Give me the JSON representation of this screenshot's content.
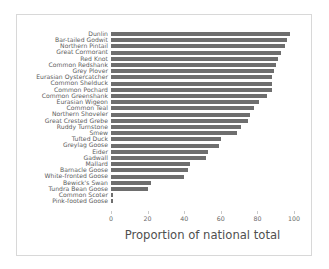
{
  "chart_data": {
    "type": "bar",
    "orientation": "horizontal",
    "title": "",
    "xlabel": "Proportion of national total",
    "ylabel": "",
    "xlim": [
      0,
      100
    ],
    "xticks": [
      0,
      20,
      40,
      60,
      80,
      100
    ],
    "xtick_labels": [
      "0",
      "20",
      "40",
      "60",
      "80",
      "100"
    ],
    "grid": false,
    "legend": null,
    "bar_color": "#6e6e6e",
    "categories": [
      "Dunlin",
      "Bar-tailed Godwit",
      "Northern Pintail",
      "Great Cormorant",
      "Red Knot",
      "Common Redshank",
      "Grey Plover",
      "Eurasian Oystercatcher",
      "Common Shelduck",
      "Common Pochard",
      "Common Greenshank",
      "Eurasian Wigeon",
      "Common Teal",
      "Northern Shoveler",
      "Great Crested Grebe",
      "Ruddy Turnstone",
      "Smew",
      "Tufted Duck",
      "Greylag Goose",
      "Eider",
      "Gadwall",
      "Mallard",
      "Barnacle Goose",
      "White-fronted Goose",
      "Bewick's Swan",
      "Tundra Bean Goose",
      "Common Scoter",
      "Pink-footed Goose"
    ],
    "values": [
      98,
      96,
      95,
      93,
      91,
      90,
      89,
      88,
      88,
      88,
      85,
      81,
      78,
      76,
      75,
      71,
      69,
      60,
      59,
      53,
      52,
      43,
      42,
      40,
      22,
      20,
      1,
      1
    ]
  },
  "axis": {
    "x_label": "Proportion of national total"
  }
}
